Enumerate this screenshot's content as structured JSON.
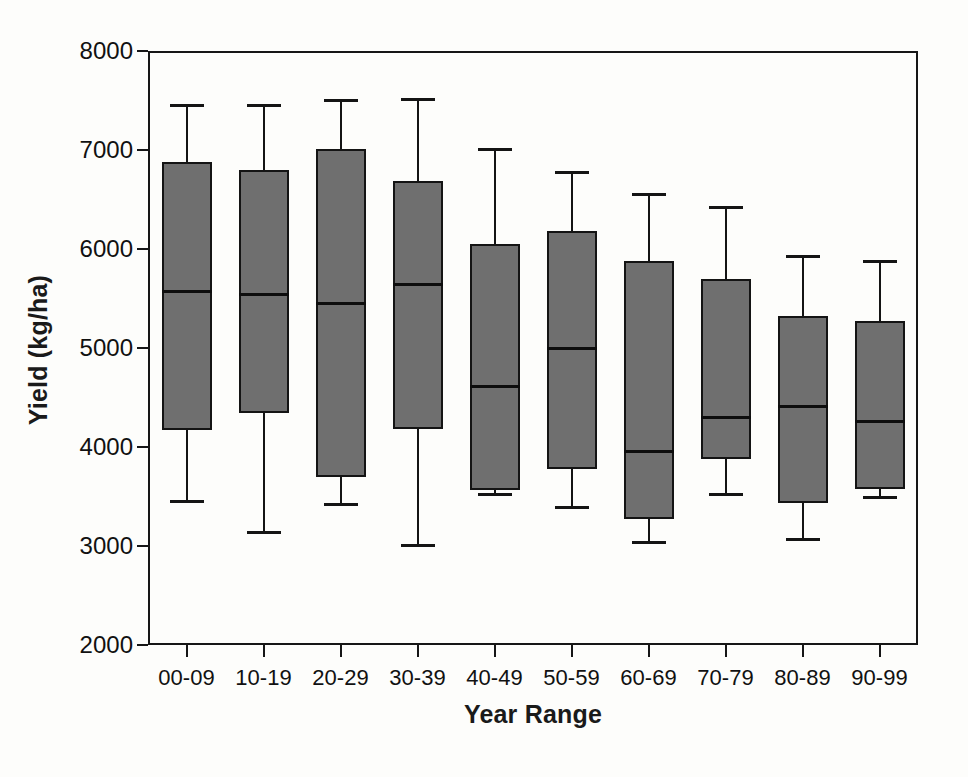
{
  "chart_data": {
    "type": "box",
    "title": "",
    "xlabel": "Year Range",
    "ylabel": "Yield (kg/ha)",
    "ylim": [
      2000,
      8000
    ],
    "yticks": [
      2000,
      3000,
      4000,
      5000,
      6000,
      7000,
      8000
    ],
    "ytick_labels": [
      "2000",
      "3000",
      "4000",
      "5000",
      "6000",
      "7000",
      "8000"
    ],
    "grid": false,
    "legend": false,
    "box_fill_color": "#6f6f6f",
    "line_color": "#141414",
    "categories": [
      "00-09",
      "10-19",
      "20-29",
      "30-39",
      "40-49",
      "50-59",
      "60-69",
      "70-79",
      "80-89",
      "90-99"
    ],
    "boxes": [
      {
        "category": "00-09",
        "whisker_low": 3450,
        "q1": 4170,
        "median": 5580,
        "q3": 6880,
        "whisker_high": 7450
      },
      {
        "category": "10-19",
        "whisker_low": 3140,
        "q1": 4340,
        "median": 5550,
        "q3": 6800,
        "whisker_high": 7450
      },
      {
        "category": "20-29",
        "whisker_low": 3420,
        "q1": 3700,
        "median": 5450,
        "q3": 7010,
        "whisker_high": 7510
      },
      {
        "category": "30-39",
        "whisker_low": 3010,
        "q1": 4180,
        "median": 5650,
        "q3": 6690,
        "whisker_high": 7520
      },
      {
        "category": "40-49",
        "whisker_low": 3530,
        "q1": 3570,
        "median": 4620,
        "q3": 6050,
        "whisker_high": 7010
      },
      {
        "category": "50-59",
        "whisker_low": 3390,
        "q1": 3780,
        "median": 5000,
        "q3": 6180,
        "whisker_high": 6780
      },
      {
        "category": "60-69",
        "whisker_low": 3040,
        "q1": 3270,
        "median": 3960,
        "q3": 5880,
        "whisker_high": 6560
      },
      {
        "category": "70-79",
        "whisker_low": 3530,
        "q1": 3880,
        "median": 4300,
        "q3": 5700,
        "whisker_high": 6420
      },
      {
        "category": "80-89",
        "whisker_low": 3070,
        "q1": 3430,
        "median": 4410,
        "q3": 5320,
        "whisker_high": 5930
      },
      {
        "category": "90-99",
        "whisker_low": 3500,
        "q1": 3580,
        "median": 4260,
        "q3": 5270,
        "whisker_high": 5880
      }
    ]
  },
  "axes": {
    "y_title": "Yield (kg/ha)",
    "x_title": "Year Range"
  }
}
